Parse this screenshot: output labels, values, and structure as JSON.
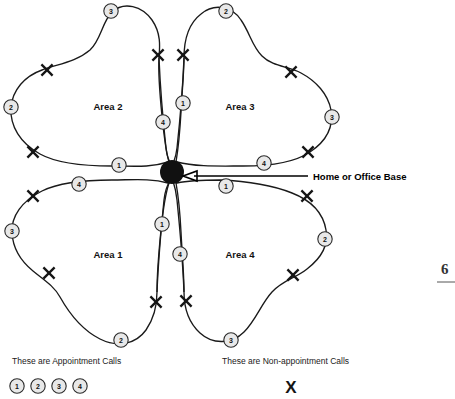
{
  "diagram": {
    "hub": {
      "name": "Home or Office Base",
      "label": "Home or Office Base",
      "cx": 172,
      "cy": 172,
      "r": 12,
      "color": "#111111"
    },
    "areas": [
      {
        "id": "area-2",
        "label": "Area 2",
        "x": 108,
        "y": 107,
        "quadrant": "top-left"
      },
      {
        "id": "area-3",
        "label": "Area 3",
        "x": 240,
        "y": 107,
        "quadrant": "top-right"
      },
      {
        "id": "area-1",
        "label": "Area 1",
        "x": 108,
        "y": 255,
        "quadrant": "bottom-left"
      },
      {
        "id": "area-4",
        "label": "Area 4",
        "x": 240,
        "y": 255,
        "quadrant": "bottom-right"
      }
    ],
    "appointment_markers": [
      {
        "n": "3",
        "x": 111,
        "y": 11,
        "area": "Area 2"
      },
      {
        "n": "2",
        "x": 11,
        "y": 107,
        "area": "Area 2"
      },
      {
        "n": "1",
        "x": 119,
        "y": 165,
        "area": "Area 2"
      },
      {
        "n": "4",
        "x": 163,
        "y": 122,
        "area": "Area 2"
      },
      {
        "n": "2",
        "x": 226,
        "y": 11,
        "area": "Area 3"
      },
      {
        "n": "1",
        "x": 183,
        "y": 103,
        "area": "Area 3"
      },
      {
        "n": "3",
        "x": 332,
        "y": 117,
        "area": "Area 3"
      },
      {
        "n": "4",
        "x": 264,
        "y": 163,
        "area": "Area 3"
      },
      {
        "n": "4",
        "x": 79,
        "y": 184,
        "area": "Area 1"
      },
      {
        "n": "3",
        "x": 12,
        "y": 231,
        "area": "Area 1"
      },
      {
        "n": "1",
        "x": 162,
        "y": 224,
        "area": "Area 1"
      },
      {
        "n": "2",
        "x": 121,
        "y": 340,
        "area": "Area 1"
      },
      {
        "n": "1",
        "x": 226,
        "y": 186,
        "area": "Area 4"
      },
      {
        "n": "2",
        "x": 325,
        "y": 239,
        "area": "Area 4"
      },
      {
        "n": "4",
        "x": 180,
        "y": 254,
        "area": "Area 4"
      },
      {
        "n": "3",
        "x": 231,
        "y": 340,
        "area": "Area 4"
      }
    ],
    "nonappointment_markers": [
      {
        "x": 47,
        "y": 70,
        "area": "Area 2"
      },
      {
        "x": 33,
        "y": 152,
        "area": "Area 2"
      },
      {
        "x": 158,
        "y": 55,
        "area": "Area 2"
      },
      {
        "x": 183,
        "y": 55,
        "area": "Area 3"
      },
      {
        "x": 291,
        "y": 72,
        "area": "Area 3"
      },
      {
        "x": 308,
        "y": 152,
        "area": "Area 3"
      },
      {
        "x": 33,
        "y": 196,
        "area": "Area 1"
      },
      {
        "x": 49,
        "y": 273,
        "area": "Area 1"
      },
      {
        "x": 156,
        "y": 302,
        "area": "Area 1"
      },
      {
        "x": 186,
        "y": 301,
        "area": "Area 4"
      },
      {
        "x": 293,
        "y": 275,
        "area": "Area 4"
      },
      {
        "x": 307,
        "y": 196,
        "area": "Area 4"
      }
    ],
    "legend": {
      "appointment": {
        "caption": "These are Appointment Calls",
        "caption_x": 12,
        "caption_y": 364,
        "symbols": [
          "1",
          "2",
          "3",
          "4"
        ],
        "symbol_y": 386,
        "symbol_start_x": 17,
        "symbol_gap": 21
      },
      "nonappointment": {
        "caption": "These are Non-appointment Calls",
        "caption_x": 222,
        "caption_y": 364,
        "symbol": "X",
        "symbol_x": 291,
        "symbol_y": 392
      }
    },
    "page_number": {
      "value": "6",
      "x": 441,
      "y": 274
    }
  }
}
